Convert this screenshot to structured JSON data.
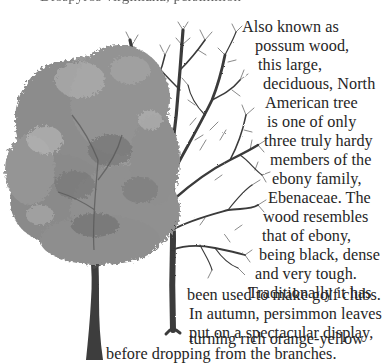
{
  "header": {
    "clipped_text": "Diospyros virginiana, persimmon"
  },
  "illustration": {
    "left_tree": {
      "label": "persimmon tree in leaf",
      "foliage_color": "#8a8a8a",
      "trunk_color": "#3c3c3c"
    },
    "right_tree": {
      "label": "persimmon tree bare in winter",
      "branch_color": "#3a3a3a"
    }
  },
  "body_text": {
    "lines": [
      "Also known as",
      "possum wood,",
      "this large,",
      "deciduous, North",
      "American tree",
      "is one of only",
      "three truly hardy",
      "members of the",
      "ebony family,",
      "Ebenaceae. The",
      "wood resembles",
      "that of ebony,",
      "being black, dense",
      "and very tough.",
      "Traditionally it has",
      "been used to make golf clubs.",
      "In autumn, persimmon leaves",
      "put on a spectacular display,",
      "turning rich orange-yellow",
      "before dropping from the branches."
    ]
  },
  "colors": {
    "text": "#262626",
    "background": "#ffffff"
  }
}
